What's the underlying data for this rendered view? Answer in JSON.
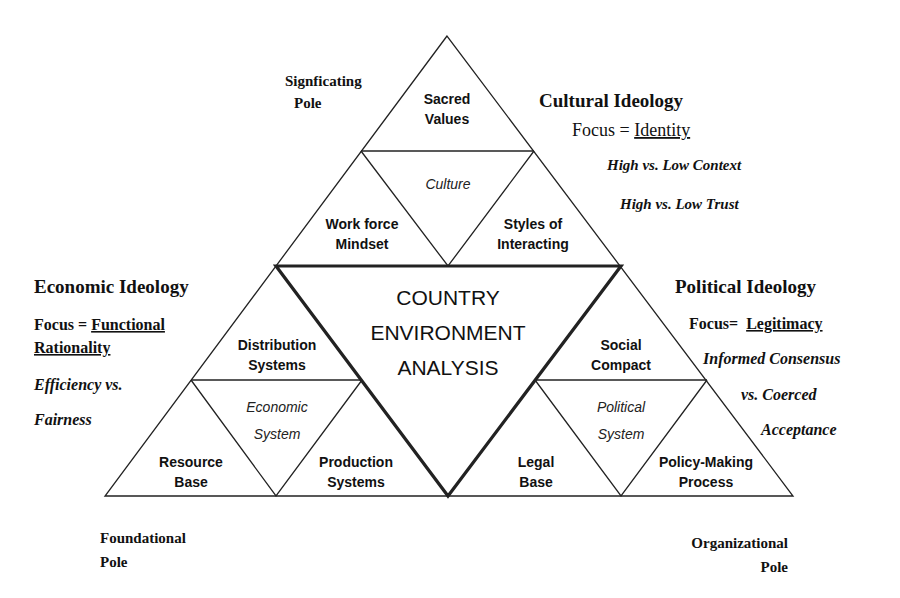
{
  "diagram": {
    "center": {
      "lines": [
        "COUNTRY",
        "ENVIRONMENT",
        "ANALYSIS"
      ]
    },
    "top_triangle": {
      "system_label": "Culture",
      "cells": {
        "top": [
          "Sacred",
          "Values"
        ],
        "left": [
          "Work force",
          "Mindset"
        ],
        "right": [
          "Styles of",
          "Interacting"
        ]
      }
    },
    "left_triangle": {
      "system_label": [
        "Economic",
        "System"
      ],
      "cells": {
        "top": [
          "Distribution",
          "Systems"
        ],
        "left": [
          "Resource",
          "Base"
        ],
        "right": [
          "Production",
          "Systems"
        ]
      }
    },
    "right_triangle": {
      "system_label": [
        "Political",
        "System"
      ],
      "cells": {
        "top": [
          "Social",
          "Compact"
        ],
        "left": [
          "Legal",
          "Base"
        ],
        "right": [
          "Policy-Making",
          "Process"
        ]
      }
    },
    "poles": {
      "top": [
        "Signficating",
        "Pole"
      ],
      "bottom_left": [
        "Foundational",
        "Pole"
      ],
      "bottom_right": [
        "Organizational",
        "Pole"
      ]
    },
    "ideologies": {
      "cultural": {
        "title": "Cultural Ideology",
        "focus_prefix": "Focus = ",
        "focus_value": "Identity",
        "points": [
          "High vs. Low Context",
          "High vs. Low Trust"
        ]
      },
      "economic": {
        "title": "Economic Ideology",
        "focus_prefix": "Focus = ",
        "focus_value_lines": [
          "Functional",
          "Rationality"
        ],
        "points": [
          "Efficiency vs.",
          "Fairness"
        ]
      },
      "political": {
        "title": "Political Ideology",
        "focus_prefix": "Focus=  ",
        "focus_value": "Legitimacy",
        "points": [
          "Informed Consensus",
          "vs. Coerced",
          "Acceptance"
        ]
      }
    }
  }
}
